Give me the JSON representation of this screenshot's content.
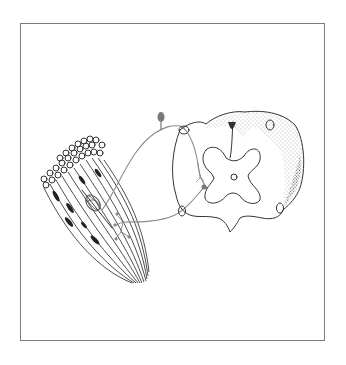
{
  "figure": {
    "type": "line-art illustration",
    "frame_color": "#7a7a7a",
    "line_color": "#333333",
    "nerve_color": "#8a8a8a",
    "elements": [
      "muscle-fiber-bundle",
      "muscle-spindle",
      "sensory-afferent-fiber",
      "dorsal-root-ganglion",
      "spinal-cord-cross-section",
      "gray-matter-butterfly",
      "central-canal",
      "motor-neuron-soma",
      "motor-efferent-fiber",
      "neuromuscular-junction",
      "stippled-white-matter-tract"
    ]
  }
}
